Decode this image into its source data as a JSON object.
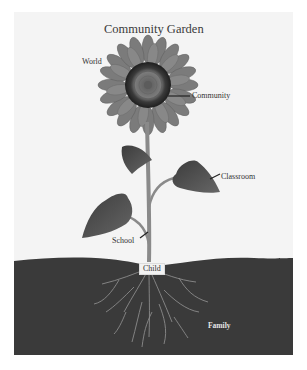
{
  "diagram": {
    "title": "Community Garden",
    "labels": {
      "world": "World",
      "community": "Community",
      "classroom": "Classroom",
      "school": "School",
      "child": "Child",
      "family": "Family"
    },
    "parts": {
      "flower_head": "Community",
      "upper_leaf_right": "Classroom",
      "lower_leaf_left": "School",
      "stem_base": "Child",
      "roots_soil": "Family",
      "background": "World"
    },
    "colors": {
      "background": "#f4f4f4",
      "petals": "#7a7a7a",
      "center_ring": "#2a2a2a",
      "center_disk": "#6a6a6a",
      "leaves": "#4e4e4e",
      "stem": "#8a8a8a",
      "soil": "#3a3a3a",
      "roots": "#9a9a9a"
    }
  }
}
